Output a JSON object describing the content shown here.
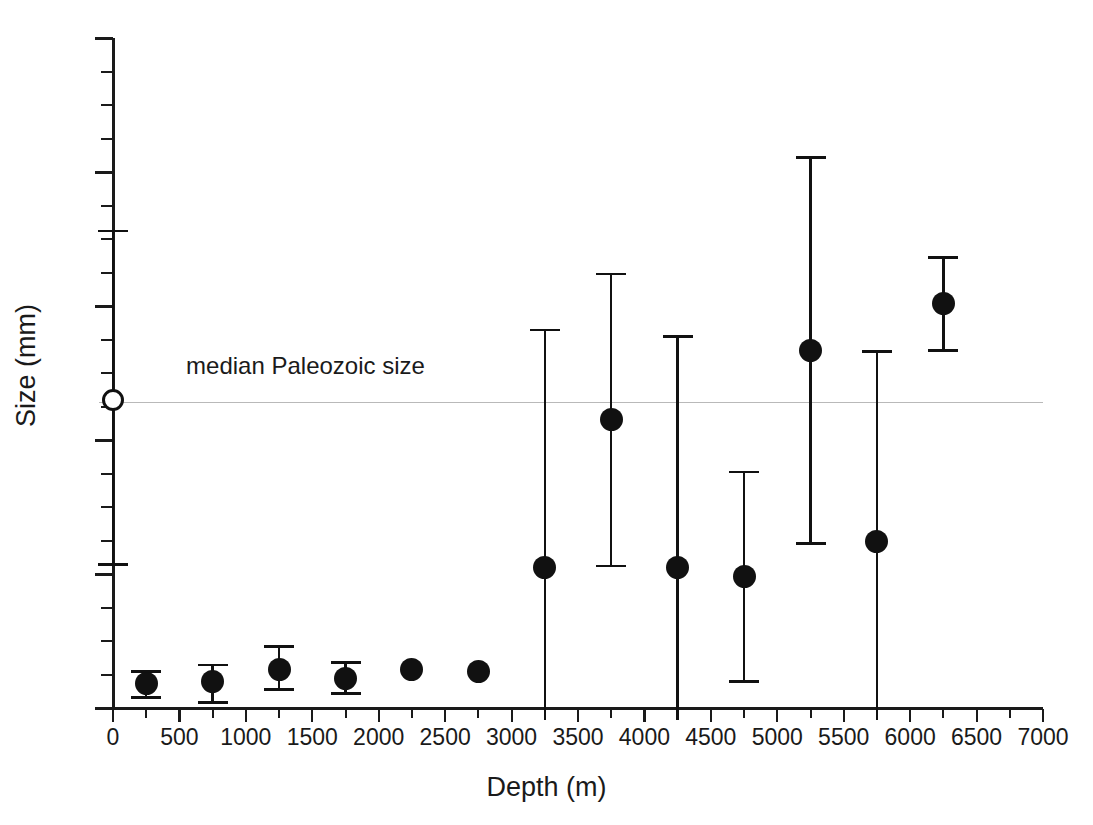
{
  "chart_data": {
    "type": "scatter",
    "title": "",
    "xlabel": "Depth (m)",
    "ylabel": "Size (mm)",
    "xlim": [
      0,
      7000
    ],
    "ylim": [
      0,
      50
    ],
    "grid": false,
    "legend": "none",
    "x_ticks": [
      0,
      500,
      1000,
      1500,
      2000,
      2500,
      3000,
      3500,
      4000,
      4500,
      5000,
      5500,
      6000,
      6500,
      7000
    ],
    "x_tick_labels": [
      "0",
      "500",
      "1000",
      "1500",
      "2000",
      "2500",
      "3000",
      "3500",
      "4000",
      "4500",
      "5000",
      "5500",
      "6000",
      "6500",
      "7000"
    ],
    "x_minor_interval": 250,
    "y_ticks": [
      0,
      10,
      20,
      30,
      40,
      50
    ],
    "y_tick_labels": [
      "0",
      "10",
      "20",
      "30",
      "40",
      "50"
    ],
    "y_minor_interval": 2.5,
    "annotations": [
      {
        "name": "median-paleozoic-line",
        "text": "median Paleozoic size",
        "type": "horizontal-reference-line",
        "y": 22.8,
        "color": "#b9b9b9",
        "text_x": 550,
        "text_y": 25.2
      }
    ],
    "series": [
      {
        "name": "median Paleozoic size marker",
        "marker": "open-circle",
        "points": [
          {
            "x": 0,
            "y": 23.0,
            "y_low": 10.6,
            "y_high": 35.7,
            "caps": true
          }
        ]
      },
      {
        "name": "sample sizes by depth",
        "marker": "filled-circle",
        "points": [
          {
            "x": 250,
            "y": 1.8,
            "y_low": 0.7,
            "y_high": 2.8,
            "caps": true
          },
          {
            "x": 750,
            "y": 2.0,
            "y_low": 0.3,
            "y_high": 3.3,
            "caps": true
          },
          {
            "x": 1250,
            "y": 2.9,
            "y_low": 1.3,
            "y_high": 4.7,
            "caps": true
          },
          {
            "x": 1750,
            "y": 2.2,
            "y_low": 1.0,
            "y_high": 3.5,
            "caps": true
          },
          {
            "x": 2250,
            "y": 2.9,
            "y_low": 2.9,
            "y_high": 2.9,
            "caps": false
          },
          {
            "x": 2750,
            "y": 2.7,
            "y_low": 2.5,
            "y_high": 3.0,
            "caps": false
          },
          {
            "x": 3250,
            "y": 10.5,
            "y_low": 0.0,
            "y_high": 28.3,
            "caps": true
          },
          {
            "x": 3750,
            "y": 21.5,
            "y_low": 10.5,
            "y_high": 32.5,
            "caps": true
          },
          {
            "x": 4250,
            "y": 10.5,
            "y_low": 0.0,
            "y_high": 27.8,
            "caps": true
          },
          {
            "x": 4750,
            "y": 9.8,
            "y_low": 1.9,
            "y_high": 17.7,
            "caps": true
          },
          {
            "x": 5250,
            "y": 26.7,
            "y_low": 12.2,
            "y_high": 41.2,
            "caps": true
          },
          {
            "x": 5750,
            "y": 12.4,
            "y_low": 0.0,
            "y_high": 26.7,
            "caps": true
          },
          {
            "x": 6250,
            "y": 30.2,
            "y_low": 26.6,
            "y_high": 33.7,
            "caps": true
          }
        ]
      }
    ]
  }
}
